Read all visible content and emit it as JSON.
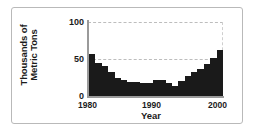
{
  "chart_data": {
    "type": "bar",
    "title": "",
    "xlabel": "Year",
    "ylabel_line1": "Thousands of",
    "ylabel_line2": "Metric Tons",
    "ylabel": "Thousands of Metric Tons",
    "ylim": [
      0,
      100
    ],
    "yticks": [
      "0",
      "50",
      "100"
    ],
    "ytick_values": [
      0,
      50,
      100
    ],
    "xticks": [
      "1980",
      "1990",
      "2000"
    ],
    "xtick_values": [
      1980,
      1990,
      2000
    ],
    "grid": "horizontal-dashed",
    "legend": "none",
    "bar_color": "#1a1a1a",
    "grid_color": "#bdbdbd",
    "axis_color": "#9a9a9a",
    "frame_color": "#b9b9b9",
    "categories": [
      "1980",
      "1981",
      "1982",
      "1983",
      "1984",
      "1985",
      "1986",
      "1987",
      "1988",
      "1989",
      "1990",
      "1991",
      "1992",
      "1993",
      "1994",
      "1995",
      "1996",
      "1997",
      "1998",
      "1999",
      "2000"
    ],
    "values": [
      57,
      44,
      40,
      33,
      24,
      22,
      19,
      19,
      18,
      18,
      21,
      21,
      18,
      14,
      20,
      27,
      33,
      37,
      43,
      52,
      62
    ]
  },
  "ytick_labels": {
    "top": "100",
    "mid": "50",
    "bottom": "0"
  },
  "xtick_labels": {
    "start": "1980",
    "mid": "1990",
    "end": "2000"
  },
  "axis_titles": {
    "x": "Year",
    "y_line1": "Thousands of",
    "y_line2": "Metric Tons"
  }
}
